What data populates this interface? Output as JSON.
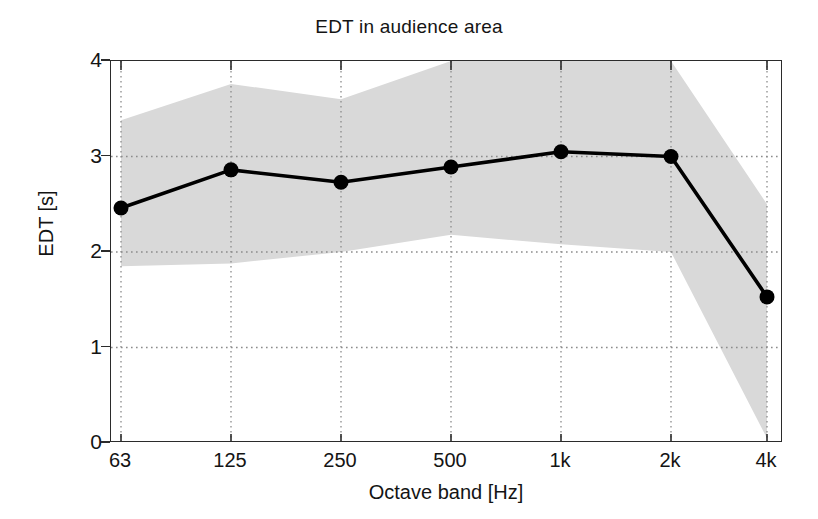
{
  "chart_data": {
    "type": "line",
    "title": "EDT in audience area",
    "xlabel": "Octave band [Hz]",
    "ylabel": "EDT [s]",
    "categories": [
      "63",
      "125",
      "250",
      "500",
      "1k",
      "2k",
      "4k"
    ],
    "x_tick_labels": [
      "63",
      "125",
      "250",
      "500",
      "1k",
      "2k",
      "4k"
    ],
    "y_tick_labels": [
      "0",
      "1",
      "2",
      "3",
      "4"
    ],
    "y_ticks": [
      0,
      1,
      2,
      3,
      4
    ],
    "ylim": [
      0,
      4
    ],
    "grid": "dotted",
    "legend": "none",
    "series": [
      {
        "name": "EDT mean",
        "marker": "filled-circle",
        "color": "#000000",
        "values": [
          2.46,
          2.86,
          2.73,
          2.89,
          3.05,
          3.0,
          1.53
        ]
      },
      {
        "name": "spread band upper",
        "type": "band-upper",
        "color": "#d9d9d9",
        "values": [
          3.38,
          3.76,
          3.6,
          4.0,
          4.0,
          4.0,
          2.5
        ]
      },
      {
        "name": "spread band lower",
        "type": "band-lower",
        "color": "#d9d9d9",
        "values": [
          1.85,
          1.88,
          2.0,
          2.18,
          2.08,
          2.0,
          0.05
        ]
      }
    ],
    "band_fill_color": "#d9d9d9",
    "axis_color": "#2b2b2b",
    "background_color": "#ffffff"
  }
}
